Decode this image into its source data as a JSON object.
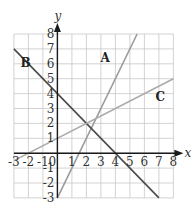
{
  "chart_data": {
    "type": "line",
    "title": "",
    "xlabel": "x",
    "ylabel": "y",
    "xlim": [
      -3,
      8
    ],
    "ylim": [
      -3,
      8
    ],
    "grid": true,
    "x_ticks": [
      "-3",
      "-2",
      "-1",
      "0",
      "1",
      "2",
      "3",
      "4",
      "5",
      "6",
      "7",
      "8"
    ],
    "y_ticks": [
      "8",
      "7",
      "6",
      "5",
      "4",
      "3",
      "2",
      "1",
      "-1",
      "-2",
      "-3"
    ],
    "y_tick_values": [
      8,
      7,
      6,
      5,
      4,
      3,
      2,
      1,
      -1,
      -2,
      -3
    ],
    "x_tick_values": [
      -3,
      -2,
      -1,
      0,
      1,
      2,
      3,
      4,
      5,
      6,
      7,
      8
    ],
    "series": [
      {
        "name": "A",
        "equation": "y = 2x - 3",
        "points": [
          [
            0,
            -3
          ],
          [
            5.5,
            8
          ]
        ],
        "color": "#9a9a9a",
        "label_at": [
          3.3,
          6.1
        ]
      },
      {
        "name": "B",
        "equation": "y = -x + 4",
        "points": [
          [
            -3,
            7
          ],
          [
            7,
            -3
          ]
        ],
        "color": "#4a4a4a",
        "label_at": [
          -2.2,
          5.8
        ]
      },
      {
        "name": "C",
        "equation": "y = 0.5x + 1",
        "points": [
          [
            -3,
            -0.5
          ],
          [
            8,
            5
          ]
        ],
        "color": "#aaaaaa",
        "label_at": [
          7.1,
          3.5
        ]
      }
    ]
  }
}
